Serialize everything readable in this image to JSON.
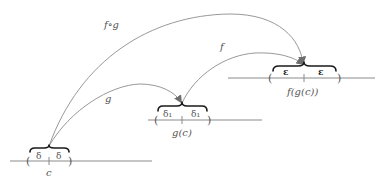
{
  "diagram": {
    "lines": [
      {
        "id": "domain-c",
        "point_label": "c",
        "interval_left_label": "δ",
        "interval_right_label": "δ"
      },
      {
        "id": "g-of-c",
        "point_label": "g(c)",
        "interval_left_label": "δ₁",
        "interval_right_label": "δ₁"
      },
      {
        "id": "f-of-g-of-c",
        "point_label": "f(g(c))",
        "interval_left_label": "ε",
        "interval_right_label": "ε"
      }
    ],
    "maps": [
      {
        "id": "composite",
        "label": "f∘g",
        "from": "c",
        "to": "f(g(c))"
      },
      {
        "id": "g",
        "label": "g",
        "from": "c",
        "to": "g(c)"
      },
      {
        "id": "f",
        "label": "f",
        "from": "g(c)",
        "to": "f(g(c))"
      }
    ],
    "parens": {
      "left": "(",
      "right": ")"
    }
  }
}
